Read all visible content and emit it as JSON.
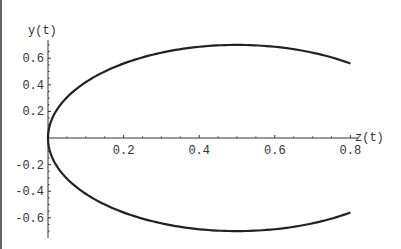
{
  "chart_data": {
    "type": "line",
    "title": "",
    "xlabel": "z(t)",
    "ylabel": "y(t)",
    "xlim": [
      0,
      0.8
    ],
    "ylim": [
      -0.75,
      0.75
    ],
    "grid": false,
    "legend": null,
    "x_ticks": [
      "0.2",
      "0.4",
      "0.6",
      "0.8"
    ],
    "y_ticks": [
      "0.6",
      "0.4",
      "0.2",
      "-0.2",
      "-0.4",
      "-0.6"
    ],
    "series": [
      {
        "name": "parametric curve (z(t), y(t))",
        "description": "Elliptical arc through origin, peak ~0.7 at z=0.5, ends at z~0.8 with y~±0.56",
        "points": [
          [
            0.8,
            -0.56
          ],
          [
            0.7,
            -0.64
          ],
          [
            0.6,
            -0.686
          ],
          [
            0.5,
            -0.7
          ],
          [
            0.4,
            -0.686
          ],
          [
            0.3,
            -0.64
          ],
          [
            0.2,
            -0.56
          ],
          [
            0.1,
            -0.42
          ],
          [
            0.05,
            -0.3
          ],
          [
            0.0,
            0.0
          ],
          [
            0.05,
            0.3
          ],
          [
            0.1,
            0.42
          ],
          [
            0.2,
            0.56
          ],
          [
            0.3,
            0.64
          ],
          [
            0.4,
            0.686
          ],
          [
            0.5,
            0.7
          ],
          [
            0.6,
            0.686
          ],
          [
            0.7,
            0.64
          ],
          [
            0.8,
            0.56
          ]
        ],
        "color": "#222222"
      }
    ]
  }
}
